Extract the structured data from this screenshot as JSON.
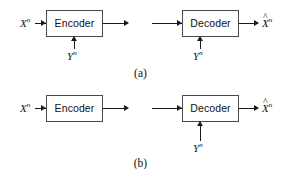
{
  "figure": {
    "panels": [
      {
        "id": "a",
        "caption": "(a)",
        "blocks": [
          {
            "name": "encoder",
            "label": "Encoder"
          },
          {
            "name": "decoder",
            "label": "Decoder"
          }
        ],
        "signals": {
          "source_input": "X",
          "source_input_sup": "n",
          "encoder_side_info": "Y",
          "encoder_side_info_sup": "n",
          "decoder_side_info": "Y",
          "decoder_side_info_sup": "n",
          "reconstruction": "X",
          "reconstruction_sup": "n",
          "reconstruction_hat": "^"
        }
      },
      {
        "id": "b",
        "caption": "(b)",
        "blocks": [
          {
            "name": "encoder",
            "label": "Encoder"
          },
          {
            "name": "decoder",
            "label": "Decoder"
          }
        ],
        "signals": {
          "source_input": "X",
          "source_input_sup": "n",
          "decoder_side_info": "Y",
          "decoder_side_info_sup": "n",
          "reconstruction": "X",
          "reconstruction_sup": "n",
          "reconstruction_hat": "^"
        }
      }
    ],
    "colors": {
      "background": "#ffffff",
      "line": "#1a1a1a",
      "box_border": "#4a4a4a",
      "text": "#101010"
    }
  }
}
